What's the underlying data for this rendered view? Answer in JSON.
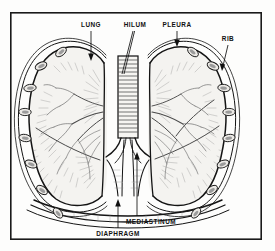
{
  "figure": {
    "background_color": "#fdfdfc",
    "ink_color": "#141414",
    "frame": {
      "name": "diagram-border",
      "x": 10,
      "y": 12,
      "width": 252,
      "height": 228,
      "stroke_width": 1.6,
      "color": "#1a1a1a"
    },
    "labels": [
      {
        "id": "lung",
        "text": "LUNG",
        "text_x": 91,
        "text_y": 25,
        "pointer": {
          "x1": 91,
          "y1": 31,
          "x2": 91,
          "y2": 60,
          "arrow": "down"
        }
      },
      {
        "id": "hilum",
        "text": "HILUM",
        "text_x": 135,
        "text_y": 25,
        "pointer": {
          "x1": 133,
          "y1": 31,
          "x2": 123,
          "y2": 70,
          "arrow": "none"
        }
      },
      {
        "id": "pleura",
        "text": "PLEURA",
        "text_x": 177,
        "text_y": 25,
        "pointer": {
          "x1": 177,
          "y1": 31,
          "x2": 177,
          "y2": 46,
          "arrow": "down"
        }
      },
      {
        "id": "rib",
        "text": "RIB",
        "text_x": 228,
        "text_y": 39,
        "pointer": {
          "x1": 228,
          "y1": 45,
          "x2": 222,
          "y2": 70,
          "arrow": "down"
        }
      },
      {
        "id": "mediastinum",
        "text": "MEDIASTINUM",
        "text_x": 151,
        "text_y": 222,
        "pointer": {
          "x1": 137,
          "y1": 216,
          "x2": 137,
          "y2": 152,
          "arrow": "up"
        }
      },
      {
        "id": "diaphragm",
        "text": "DIAPHRAGM",
        "text_x": 118,
        "text_y": 234,
        "pointer": {
          "x1": 118,
          "y1": 228,
          "x2": 118,
          "y2": 199,
          "arrow": "up"
        }
      }
    ],
    "structures": [
      {
        "id": "left-lung",
        "name": "left-lung",
        "label": "LUNG"
      },
      {
        "id": "right-lung",
        "name": "right-lung",
        "label": "LUNG"
      },
      {
        "id": "trachea",
        "name": "trachea",
        "label": "HILUM"
      },
      {
        "id": "pleural-membrane",
        "name": "pleural-membrane",
        "label": "PLEURA"
      },
      {
        "id": "ribs",
        "name": "rib-cross-sections",
        "label": "RIB",
        "count_left": 7,
        "count_right": 7
      },
      {
        "id": "diaphragm",
        "name": "diaphragm",
        "label": "DIAPHRAGM"
      },
      {
        "id": "mediastinum",
        "name": "mediastinum",
        "label": "MEDIASTINUM"
      }
    ]
  }
}
